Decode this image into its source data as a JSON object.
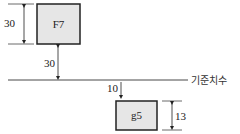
{
  "diagram": {
    "hole_box": {
      "label": "F7",
      "height_dim": "30",
      "offset_dim": "30"
    },
    "shaft_box": {
      "label": "g5",
      "height_dim": "13",
      "offset_dim": "10"
    },
    "baseline": {
      "label": "기준치수"
    }
  },
  "colors": {
    "box_fill": "#e6e6e6",
    "stroke": "#222222"
  }
}
